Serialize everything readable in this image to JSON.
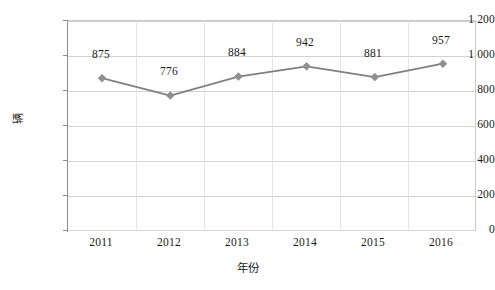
{
  "chart_data": {
    "type": "line",
    "title": "",
    "xlabel": "年份",
    "ylabel": "辆",
    "categories": [
      "2011",
      "2012",
      "2013",
      "2014",
      "2015",
      "2016"
    ],
    "values": [
      875,
      776,
      884,
      942,
      881,
      957
    ],
    "point_labels": [
      "875",
      "776",
      "884",
      "942",
      "881",
      "957"
    ],
    "ylim": [
      0,
      1200
    ],
    "ytick_values": [
      0,
      200,
      400,
      600,
      800,
      1000,
      1200
    ],
    "ytick_labels": [
      "0",
      "200",
      "400",
      "600",
      "800",
      "1 000",
      "1 200"
    ],
    "grid": true,
    "legend": "none",
    "series": [
      {
        "name": "",
        "values": [
          875,
          776,
          884,
          942,
          881,
          957
        ],
        "line_color": "#808080",
        "marker": "diamond",
        "marker_color": "#909090"
      }
    ],
    "colors": {
      "line": "#808080",
      "marker": "#909090",
      "gridline": "#d2d2d2",
      "plot_border": "#c9c9c9",
      "axis": "#8c8c8c",
      "text": "#1a1a1a",
      "background": "#ffffff"
    }
  }
}
